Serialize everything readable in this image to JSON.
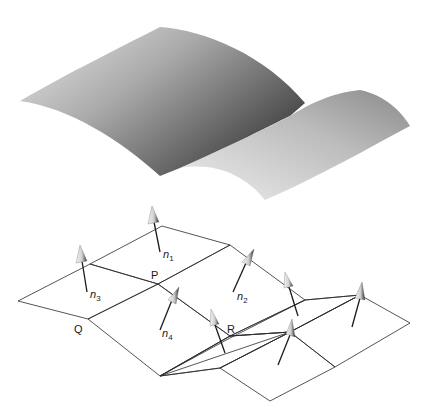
{
  "figure": {
    "top_surface": {
      "description": "smooth curved surface",
      "colors": {
        "light": "#e6e6e6",
        "mid": "#a8a8a8",
        "dark": "#4a4a4a"
      }
    },
    "mesh": {
      "description": "polygonal approximation with surface normals",
      "colors": {
        "light_facet": "#d4d4d4",
        "mid_facet": "#a0a0a0",
        "dark_facet": "#8a8a8a",
        "edge": "#2a2a2a",
        "arrow_shaft": "#1a1a1a"
      }
    },
    "vertex_labels": {
      "P": "P",
      "Q": "Q",
      "R": "R"
    },
    "normal_labels": [
      {
        "base": "n",
        "sub": "1"
      },
      {
        "base": "n",
        "sub": "2"
      },
      {
        "base": "n",
        "sub": "3"
      },
      {
        "base": "n",
        "sub": "4"
      }
    ]
  }
}
